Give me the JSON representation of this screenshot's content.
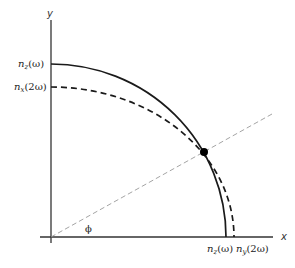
{
  "diagram": {
    "axes": {
      "x_label": "x",
      "y_label": "y"
    },
    "angle_label": "ϕ",
    "y_intercepts": [
      {
        "n": "n",
        "sub": "z",
        "arg": "(ω)",
        "style": "solid"
      },
      {
        "n": "n",
        "sub": "x",
        "arg": "(2ω)",
        "style": "dashed"
      }
    ],
    "x_intercepts": [
      {
        "n": "n",
        "sub": "z",
        "arg": "(ω)",
        "style": "solid"
      },
      {
        "n": "n",
        "sub": "y",
        "arg": "(2ω)",
        "style": "dashed"
      }
    ],
    "curves": [
      {
        "name": "n_z(omega) circle",
        "style": "solid",
        "color": "#1a1a1a"
      },
      {
        "name": "n(2omega) ellipse",
        "style": "dashed",
        "color": "#1a1a1a"
      }
    ],
    "phase_match_line": {
      "style": "dashed",
      "color": "#9a9a9a"
    },
    "intersection_point": {
      "marker": "filled-circle",
      "color": "#000000"
    }
  }
}
